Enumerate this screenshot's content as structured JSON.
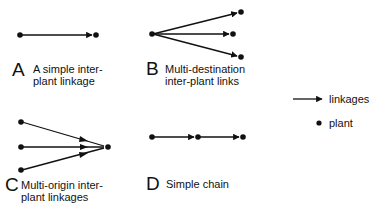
{
  "panels": [
    {
      "letter": "A",
      "caption_line1": "A simple inter-",
      "caption_line2": "plant linkage"
    },
    {
      "letter": "B",
      "caption_line1": "Multi-destination",
      "caption_line2": "inter-plant links"
    },
    {
      "letter": "C",
      "caption_line1": "Multi-origin inter-",
      "caption_line2": "plant linkages"
    },
    {
      "letter": "D",
      "caption_line1": "Simple chain",
      "caption_line2": ""
    }
  ],
  "legend": {
    "linkages_label": "linkages",
    "plant_label": "plant"
  },
  "colors": {
    "ink": "#111111",
    "background": "#ffffff"
  }
}
